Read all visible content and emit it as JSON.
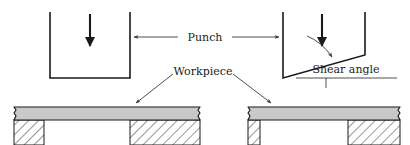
{
  "figure": {
    "colors": {
      "line": "#1a1a1a",
      "leader": "#4a4a4a",
      "workpiece_fill": "#c9c9c9",
      "workpiece_stroke": "#1a1a1a",
      "hatch": "#1a1a1a",
      "background": "#ffffff"
    }
  },
  "labels": {
    "punch": "Punch",
    "workpiece": "Workpiece",
    "shear_angle": "Shear angle"
  },
  "left_assembly": {
    "name": "flat-punch-assembly",
    "punch": {
      "type": "flat-bottom-punch",
      "left_x": 50,
      "right_x": 130,
      "top_y": 12,
      "bottom_y": 78
    },
    "force_arrow": {
      "name": "downward-force-arrow",
      "x": 90,
      "from_y": 14,
      "to_y": 48
    },
    "workpiece_bar": {
      "left_x": 14,
      "right_x": 200,
      "top_y": 107,
      "bottom_y": 120
    },
    "die_gap": {
      "left_x": 44,
      "right_x": 130
    }
  },
  "right_assembly": {
    "name": "shear-angle-punch-assembly",
    "punch": {
      "type": "shear-angle-punch",
      "left_x": 283,
      "right_x": 365,
      "top_y": 12,
      "tip_y": 78,
      "heel_y": 55
    },
    "force_arrow": {
      "name": "downward-force-arrow",
      "x": 322,
      "from_y": 14,
      "to_y": 48
    },
    "workpiece_bar": {
      "left_x": 248,
      "right_x": 400,
      "top_y": 107,
      "bottom_y": 120
    },
    "die_gap": {
      "left_x": 260,
      "right_x": 348
    }
  },
  "leaders": {
    "punch_left_arrow": {
      "name": "punch-leader-left",
      "from_x": 178,
      "to_x": 133,
      "y": 37
    },
    "punch_right_arrow": {
      "name": "punch-leader-right",
      "from_x": 232,
      "to_x": 280,
      "y": 37
    },
    "workpiece_left_arrow": {
      "name": "workpiece-leader-left",
      "from_x": 173,
      "from_y": 74,
      "to_x": 135,
      "to_y": 104
    },
    "workpiece_right_arrow": {
      "name": "workpiece-leader-right",
      "from_x": 233,
      "from_y": 74,
      "to_x": 272,
      "to_y": 104
    },
    "shear_angle_arrow": {
      "name": "shear-angle-leader",
      "from_x": 307,
      "from_y": 36,
      "to_x": 333,
      "to_y": 58
    },
    "shear_angle_underline": {
      "name": "shear-angle-underline",
      "from_x": 296,
      "to_x": 397,
      "y": 78
    },
    "shear_angle_tick": {
      "name": "shear-angle-tick",
      "x": 326,
      "from_y": 78,
      "to_y": 88
    }
  }
}
